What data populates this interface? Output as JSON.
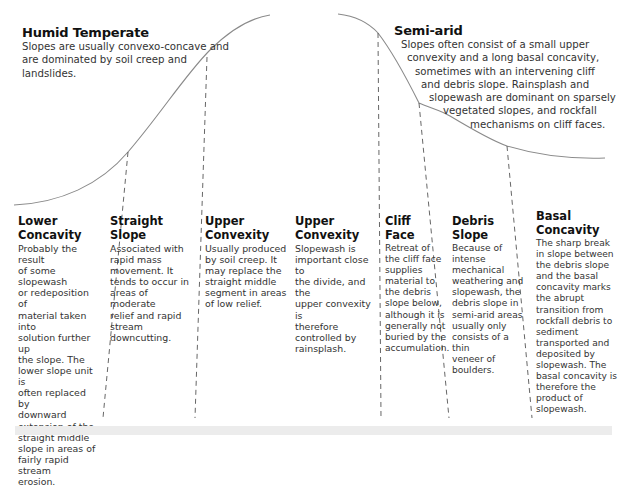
{
  "humid": {
    "title": "Humid Temperate",
    "description_lines": [
      "Slopes are usually convexo-concave and",
      "are dominated by soil creep and",
      "landslides."
    ]
  },
  "semi_arid": {
    "title": "Semi-arid",
    "description_lines": [
      "Slopes often consist of a small upper",
      "convexity and a long basal concavity,",
      "sometimes with an intervening cliff",
      "and debris slope. Rainsplash and",
      "slopewash are dominant on sparsely",
      "vegetated slopes, and rockfall",
      "mechanisms on cliff faces."
    ]
  },
  "columns": [
    {
      "title_lines": [
        "Lower",
        "Concavity"
      ],
      "description_lines": [
        "Probably the result",
        "of some slopewash",
        "or redeposition of",
        "material taken into",
        "solution further up",
        "the slope. The",
        "lower slope unit is",
        "often replaced by",
        "downward",
        "extension of the",
        "straight middle",
        "slope in areas of",
        "fairly rapid stream",
        "erosion."
      ]
    },
    {
      "title_lines": [
        "Straight",
        "Slope"
      ],
      "description_lines": [
        "Associated with",
        "rapid mass",
        "movement. It",
        "tends to occur in",
        "areas of moderate",
        "relief and rapid",
        "stream",
        "downcutting."
      ]
    },
    {
      "title_lines": [
        "Upper",
        "Convexity"
      ],
      "description_lines": [
        "Usually produced",
        "by soil creep. It",
        "may replace the",
        "straight middle",
        "segment in areas",
        "of low relief."
      ]
    },
    {
      "title_lines": [
        "Upper",
        "Convexity"
      ],
      "description_lines": [
        "Slopewash is",
        "important close to",
        "the divide, and the",
        "upper convexity is",
        "therefore",
        "controlled by",
        "rainsplash."
      ]
    },
    {
      "title_lines": [
        "Cliff",
        "Face"
      ],
      "description_lines": [
        "Retreat of",
        "the cliff face",
        "supplies",
        "material to",
        "the debris",
        "slope below,",
        "although it is",
        "generally not",
        "buried by the",
        "accumulation."
      ]
    },
    {
      "title_lines": [
        "Debris",
        "Slope"
      ],
      "description_lines": [
        "Because of",
        "intense",
        "mechanical",
        "weathering and",
        "slopewash, the",
        "debris slope in",
        "semi-arid areas",
        "usually only",
        "consists of a thin",
        "veneer of",
        "boulders."
      ]
    },
    {
      "title_lines": [
        "Basal",
        "Concavity"
      ],
      "description_lines": [
        "The sharp break",
        "in slope between",
        "the debris slope",
        "and the basal",
        "concavity marks",
        "the abrupt",
        "transition from",
        "rockfall debris to",
        "sediment",
        "transported and",
        "deposited by",
        "slopewash. The",
        "basal concavity is",
        "therefore the",
        "product of",
        "slopewash."
      ]
    }
  ],
  "colors": {
    "profile_line": "#8a8a8a",
    "dashed_line": "#555555",
    "text": "#231f20",
    "bottom_band": "#ececec"
  }
}
